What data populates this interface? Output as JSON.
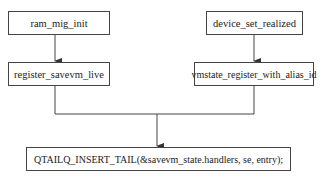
{
  "diagram": {
    "type": "flowchart",
    "nodes": [
      {
        "id": "n1",
        "label": "ram_mig_init"
      },
      {
        "id": "n2",
        "label": "register_savevm_live"
      },
      {
        "id": "n3",
        "label": "device_set_realized"
      },
      {
        "id": "n4",
        "label": "vmstate_register_with_alias_id"
      },
      {
        "id": "n5",
        "label": "QTAILQ_INSERT_TAIL(&savevm_state.handlers, se, entry);"
      }
    ],
    "edges": [
      {
        "from": "n1",
        "to": "n2"
      },
      {
        "from": "n3",
        "to": "n4"
      },
      {
        "from": "n2",
        "to": "n5"
      },
      {
        "from": "n4",
        "to": "n5"
      }
    ],
    "colors": {
      "line": "#444444",
      "background": "#ffffff",
      "text": "#222222"
    }
  }
}
